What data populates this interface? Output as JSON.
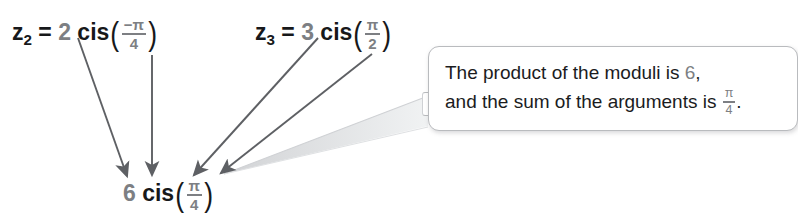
{
  "canvas": {
    "width": 780,
    "height": 212,
    "background": "#ffffff"
  },
  "colors": {
    "ink": "#17181a",
    "gray_value": "#7d7f83",
    "arrow": "#5e6064",
    "callout_border": "#b9bbbe",
    "callout_tail": "#dcdee1"
  },
  "expressions": {
    "z2": {
      "name": "z2",
      "label": "z",
      "subscript": "2",
      "equals": "=",
      "modulus": "2",
      "cis": "cis",
      "open_paren": "(",
      "close_paren": ")",
      "argument_numerator": "−π",
      "argument_denominator": "4",
      "plain": "z₂ = 2 cis(−π/4)"
    },
    "z3": {
      "name": "z3",
      "label": "z",
      "subscript": "3",
      "equals": "=",
      "modulus": "3",
      "cis": "cis",
      "open_paren": "(",
      "close_paren": ")",
      "argument_numerator": "π",
      "argument_denominator": "2",
      "plain": "z₃ = 3 cis(π/2)"
    },
    "result": {
      "name": "product",
      "modulus": "6",
      "cis": "cis",
      "open_paren": "(",
      "close_paren": ")",
      "argument_numerator": "π",
      "argument_denominator": "4",
      "plain": "6 cis(π/4)"
    }
  },
  "callout": {
    "line1_prefix": "The product of the moduli is ",
    "line1_value": "6",
    "line1_suffix": ",",
    "line2_prefix": "and the sum of the arguments is ",
    "line2_value_numerator": "π",
    "line2_value_denominator": "4",
    "line2_suffix": ".",
    "plain": "The product of the moduli is 6, and the sum of the arguments is π/4."
  },
  "arrows": [
    {
      "name": "arrow-modulus-2",
      "from": [
        78,
        38
      ],
      "to": [
        127,
        179
      ],
      "source": "2",
      "target": "6"
    },
    {
      "name": "arrow-argument-pi4",
      "from": [
        152,
        55
      ],
      "to": [
        152,
        178
      ],
      "source": "−π/4",
      "target": "π/4"
    },
    {
      "name": "arrow-modulus-3",
      "from": [
        318,
        38
      ],
      "to": [
        192,
        178
      ],
      "source": "3",
      "target": "6"
    },
    {
      "name": "arrow-argument-pi2",
      "from": [
        372,
        54
      ],
      "to": [
        218,
        176
      ],
      "source": "π/2",
      "target": "π/4"
    }
  ]
}
